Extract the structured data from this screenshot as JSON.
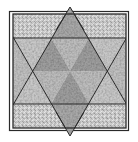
{
  "diagram": {
    "type": "quilt-block-hexagram",
    "colors": {
      "background": "#ffffff",
      "light_fabric": "#d4d4d4",
      "medium_fabric": "#b3b3b3",
      "dark_fabric": "#9a9a9a",
      "line": "#2a2a2a"
    },
    "border": {
      "outer": {
        "x": 9,
        "y": 11,
        "w": 120,
        "h": 120
      },
      "inner": {
        "x": 13,
        "y": 14,
        "w": 113,
        "h": 114
      }
    },
    "star": {
      "up_triangle": [
        [
          70,
          7
        ],
        [
          14,
          104
        ],
        [
          126,
          104
        ]
      ],
      "down_triangle": [
        [
          70,
          136
        ],
        [
          14,
          38
        ],
        [
          126,
          38
        ]
      ],
      "center": [
        70,
        71
      ]
    }
  }
}
